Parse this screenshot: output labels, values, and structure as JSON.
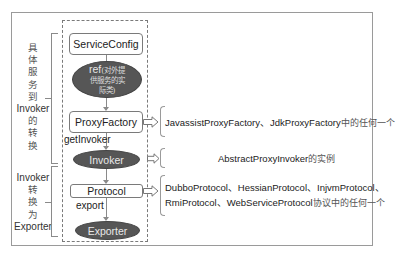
{
  "diagram": {
    "left_groups": [
      {
        "label_parts": [
          "具",
          "体",
          "服",
          "务",
          "到",
          "Invoker",
          "的",
          "转",
          "换"
        ]
      },
      {
        "label_parts": [
          "Invoker",
          "转",
          "换",
          "为",
          "Exporter"
        ]
      }
    ],
    "nodes": {
      "service_config": "ServiceConfig",
      "ref_prefix": "ref",
      "ref_desc_line1": "(对外提",
      "ref_desc_line2": "供服务的实",
      "ref_desc_line3": "际类)",
      "proxy_factory": "ProxyFactory",
      "invoker": "Invoker",
      "protocol": "Protocol",
      "exporter": "Exporter"
    },
    "edge_labels": {
      "get_invoker": "getInvoker",
      "export": "export"
    },
    "annotations": {
      "proxy_factory": {
        "text": "JavassistProxyFactory、JdkProxyFactory",
        "suffix": "中的任何一个"
      },
      "invoker": {
        "text": "AbstractProxyInvoker",
        "suffix": "的实例"
      },
      "protocol": {
        "line1": "DubboProtocol、HessianProtocol、InjvmProtocol、",
        "line2": "RmiProtocol、WebServiceProtocol",
        "line2_suffix": "协议中的任何一个"
      }
    },
    "colors": {
      "ellipse_fill": "#565656",
      "box_border": "#7a7a7a",
      "frame_border": "#9a9a9a"
    }
  }
}
